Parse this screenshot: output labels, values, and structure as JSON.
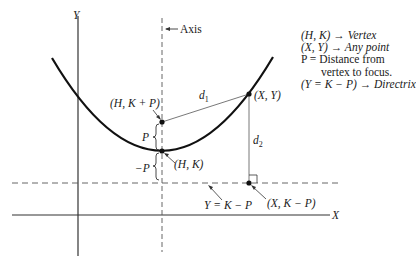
{
  "diagram": {
    "type": "parabola-geometry",
    "axes": {
      "x_label": "X",
      "y_label": "Y"
    },
    "axis_of_symmetry_label": "Axis",
    "points": {
      "focus": "(H, K + P)",
      "vertex": "(H, K)",
      "any_point": "(X, Y)",
      "directrix_foot": "(X, K − P)"
    },
    "distances": {
      "d1": "d",
      "d1_sub": "1",
      "d2": "d",
      "d2_sub": "2",
      "p_plus": "P",
      "p_minus": "−P"
    },
    "directrix_label": "Y = K − P",
    "legend": [
      "(H, K) → Vertex",
      "(X, Y) → Any point",
      "P = Distance from",
      "vertex to focus.",
      "(Y = K − P) → Directrix"
    ]
  }
}
